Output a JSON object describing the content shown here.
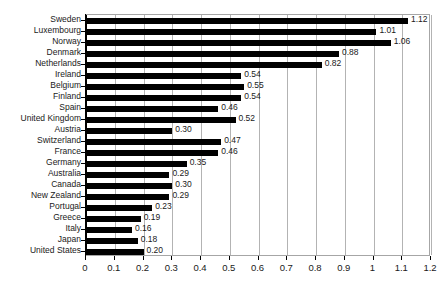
{
  "chart_data": {
    "type": "bar",
    "orientation": "horizontal",
    "title": "",
    "subtitle": "",
    "xlabel": "",
    "ylabel": "",
    "xlim": [
      0,
      1.2
    ],
    "ylim": null,
    "grid": true,
    "grid_axis": "x",
    "legend": false,
    "legend_position": "none",
    "data_labels": true,
    "data_label_format": "0.00",
    "xticks": [
      0,
      0.1,
      0.2,
      0.3,
      0.4,
      0.5,
      0.6,
      0.7,
      0.8,
      0.9,
      1,
      1.1,
      1.2
    ],
    "xtick_labels": [
      "0",
      "0.1",
      "0.2",
      "0.3",
      "0.4",
      "0.5",
      "0.6",
      "0.7",
      "0.8",
      "0.9",
      "1",
      "1.1",
      "1.2"
    ],
    "categories": [
      "Sweden",
      "Luxembourg",
      "Norway",
      "Denmark",
      "Netherlands",
      "Ireland",
      "Belgium",
      "Finland",
      "Spain",
      "United Kingdom",
      "Austria",
      "Switzerland",
      "France",
      "Germany",
      "Australia",
      "Canada",
      "New Zealand",
      "Portugal",
      "Greece",
      "Italy",
      "Japan",
      "United States"
    ],
    "values": [
      1.12,
      1.01,
      1.06,
      0.88,
      0.82,
      0.54,
      0.55,
      0.54,
      0.46,
      0.52,
      0.3,
      0.47,
      0.46,
      0.35,
      0.29,
      0.3,
      0.29,
      0.23,
      0.19,
      0.16,
      0.18,
      0.2
    ],
    "value_labels": [
      "1.12",
      "1.01",
      "1.06",
      "0.88",
      "0.82",
      "0.54",
      "0.55",
      "0.54",
      "0.46",
      "0.52",
      "0.30",
      "0.47",
      "0.46",
      "0.35",
      "0.29",
      "0.30",
      "0.29",
      "0.23",
      "0.19",
      "0.16",
      "0.18",
      "0.20"
    ],
    "colors": {
      "bar": "#000000",
      "background": "#ffffff",
      "grid": "#b3b3b3",
      "frame": "#a6a6a6",
      "axis": "#000000",
      "text": "#1a1a1a"
    }
  }
}
